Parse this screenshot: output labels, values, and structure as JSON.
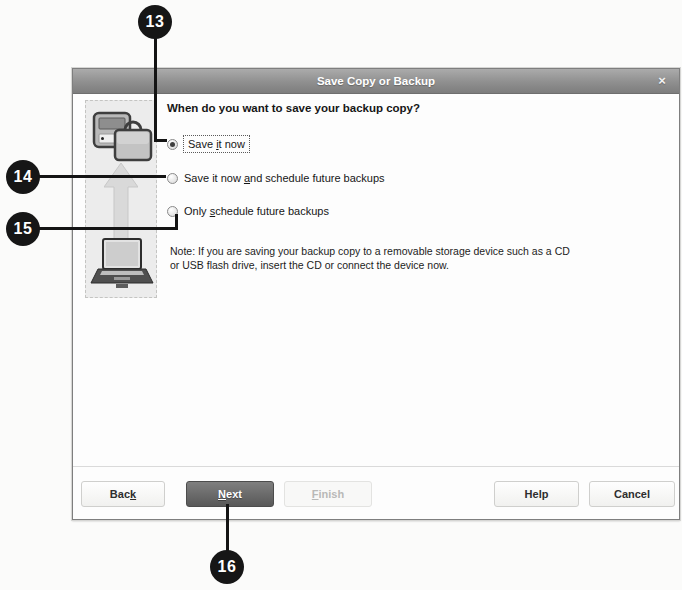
{
  "callouts": [
    {
      "number": "13",
      "points_to": "save-it-now-radio"
    },
    {
      "number": "14",
      "points_to": "save-and-schedule-radio"
    },
    {
      "number": "15",
      "points_to": "only-schedule-radio"
    },
    {
      "number": "16",
      "points_to": "next-button"
    }
  ],
  "dialog": {
    "title": "Save Copy or Backup",
    "close_glyph": "×",
    "heading": "When do you want to save your backup copy?",
    "radios": [
      {
        "pre": "Save ",
        "key": "i",
        "post": "t now",
        "selected": true
      },
      {
        "pre": "Save it now ",
        "key": "a",
        "post": "nd schedule future backups",
        "selected": false
      },
      {
        "pre": "Only ",
        "key": "s",
        "post": "chedule future backups",
        "selected": false
      }
    ],
    "note": {
      "line1": "Note: If you are saving your backup copy to a removable storage device such as a CD",
      "line2": "or USB flash drive, insert the CD or connect the device now."
    },
    "buttons": {
      "back": {
        "pre": "Bac",
        "key": "k",
        "post": ""
      },
      "next": {
        "pre": "",
        "key": "N",
        "post": "ext"
      },
      "finish": {
        "pre": "",
        "key": "F",
        "post": "inish"
      },
      "help": {
        "pre": "Help",
        "key": "",
        "post": ""
      },
      "cancel": {
        "pre": "Cancel",
        "key": "",
        "post": ""
      }
    },
    "icons": {
      "side_top": "backup-device-and-briefcase-icon",
      "side_middle": "up-arrow-icon",
      "side_bottom": "laptop-icon"
    }
  },
  "colors": {
    "badge": "#161616",
    "titlebar_top": "#ababab",
    "titlebar_bottom": "#7d7d7d",
    "next_button": "#6a6a6a",
    "dialog_bg": "#fdfdfd",
    "side_panel_bg": "#ececec"
  }
}
